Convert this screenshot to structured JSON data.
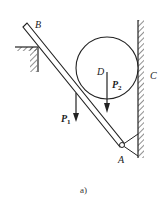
{
  "figure": {
    "caption": "a)",
    "labels": {
      "B": "B",
      "C": "C",
      "D": "D",
      "A": "A",
      "P1": "P",
      "P1_sub": "1",
      "P2": "P",
      "P2_sub": "2"
    },
    "components": [
      "inclined bar AB",
      "circular cylinder D",
      "vertical wall C",
      "fixed ledge at upper left",
      "pin support A with bracket to wall"
    ],
    "colors": {
      "ink": "#222222",
      "background": "#ffffff"
    }
  }
}
